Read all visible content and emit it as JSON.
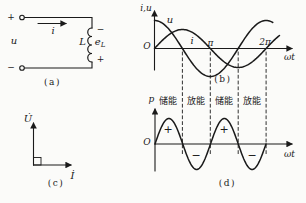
{
  "figure": {
    "background": "#fbfbf9",
    "ink": "#1a1a1a",
    "panels": {
      "a": {
        "caption": "(a)",
        "terminal_plus": "+",
        "terminal_minus": "−",
        "source_label": "u",
        "current_label": "i",
        "inductor_label": "L",
        "emf_base": "e",
        "emf_sub": "L",
        "emf_polarity_top": "−",
        "emf_polarity_bottom": "+"
      },
      "b": {
        "caption": "(b)",
        "origin": "O"
      },
      "c": {
        "caption": "(c)",
        "voltage_phasor": "U̇",
        "current_phasor": "İ",
        "angle_marker": "90° square"
      },
      "d": {
        "caption": "(d)",
        "origin": "O"
      }
    }
  },
  "chart_data": [
    {
      "id": "b",
      "type": "line",
      "xlabel": "ωt",
      "ylabel": "i,u",
      "x_range_pi": [
        0,
        2
      ],
      "x_ticks": [
        {
          "pi": 1,
          "label": "π"
        },
        {
          "pi": 2,
          "label": "2π"
        }
      ],
      "series": [
        {
          "name": "u",
          "fn": "cos",
          "freq": 1,
          "rel_amplitude": 1.0,
          "amp_px": 28,
          "end_pi": 2.12
        },
        {
          "name": "i",
          "fn": "sin",
          "freq": 1,
          "rel_amplitude": 0.68,
          "amp_px": 19,
          "end_pi": 2.25
        }
      ],
      "dashed_lines_pi": [
        0.5,
        1,
        1.5,
        2
      ],
      "legend_position": "on-curve"
    },
    {
      "id": "d",
      "type": "line",
      "xlabel": "ωt",
      "ylabel": "p",
      "x_range_pi": [
        0,
        2
      ],
      "series": [
        {
          "name": "p",
          "fn": "sin",
          "freq": 2,
          "rel_amplitude": 1.0,
          "amp_px": 25.5,
          "end_pi": 2
        }
      ],
      "regions": [
        {
          "from_pi": 0,
          "to_pi": 0.5,
          "label": "储能",
          "sign": "+"
        },
        {
          "from_pi": 0.5,
          "to_pi": 1,
          "label": "放能",
          "sign": "−"
        },
        {
          "from_pi": 1,
          "to_pi": 1.5,
          "label": "储能",
          "sign": "+"
        },
        {
          "from_pi": 1.5,
          "to_pi": 2,
          "label": "放能",
          "sign": "−"
        }
      ]
    }
  ]
}
